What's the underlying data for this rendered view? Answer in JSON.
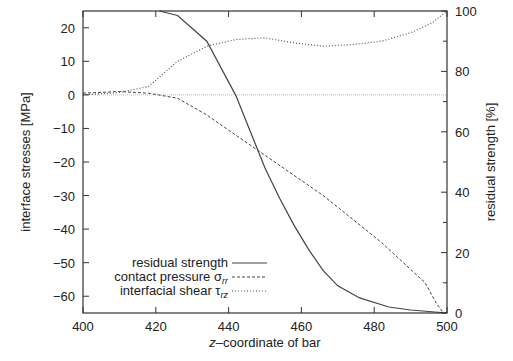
{
  "chart_data": {
    "type": "line",
    "title": "",
    "xlabel": "z–coordinate of bar",
    "ylabel": "interface stresses [MPa]",
    "y2label": "residual strength [%]",
    "xlim": [
      400,
      500
    ],
    "ylim": [
      -65,
      25
    ],
    "y2lim": [
      0,
      100
    ],
    "x_ticks": [
      400,
      420,
      440,
      460,
      480,
      500
    ],
    "y_ticks": [
      20,
      10,
      0,
      -10,
      -20,
      -30,
      -40,
      -50,
      -60
    ],
    "y2_ticks": [
      0,
      20,
      40,
      60,
      80,
      100
    ],
    "grid": false,
    "legend_position": "lower left",
    "series": [
      {
        "name": "residual strength",
        "axis": "right",
        "style": "solid",
        "x": [
          421,
          426,
          434,
          442,
          446,
          450,
          454,
          458,
          462,
          466,
          470,
          476,
          484,
          490,
          500
        ],
        "values": [
          100,
          98.5,
          90,
          72,
          60,
          48,
          38,
          29,
          21,
          14,
          9,
          5,
          2,
          1,
          0
        ]
      },
      {
        "name": "contact pressure σrr",
        "axis": "left",
        "style": "dashed",
        "x": [
          400,
          410,
          418,
          426,
          434,
          442,
          450,
          458,
          466,
          474,
          482,
          490,
          494,
          497,
          499
        ],
        "values": [
          0.5,
          1,
          0.5,
          -1,
          -6,
          -12,
          -18,
          -24,
          -30,
          -37,
          -44,
          -52,
          -56,
          -62,
          -65
        ]
      },
      {
        "name": "interfacial shear τrz",
        "axis": "left",
        "style": "dotted",
        "x": [
          400,
          410,
          418,
          426,
          434,
          442,
          450,
          458,
          466,
          474,
          482,
          490,
          496,
          500
        ],
        "values": [
          0,
          0.7,
          2.5,
          10,
          14.5,
          16.5,
          17,
          15.5,
          14.5,
          15,
          16,
          18.5,
          21.5,
          25
        ]
      }
    ],
    "reference_lines": [
      {
        "axis": "left",
        "y": 0,
        "style": "dotted-thin"
      }
    ]
  },
  "legend": {
    "residual": "residual strength",
    "contact_main": "contact pressure σ",
    "contact_sub": "rr",
    "shear_main": "interfacial shear τ",
    "shear_sub": "rz"
  },
  "axes": {
    "xlabel_italic": "z",
    "xlabel_rest": "–coordinate of bar",
    "ylabel": "interface stresses [MPa]",
    "y2label": "residual strength [%]"
  }
}
